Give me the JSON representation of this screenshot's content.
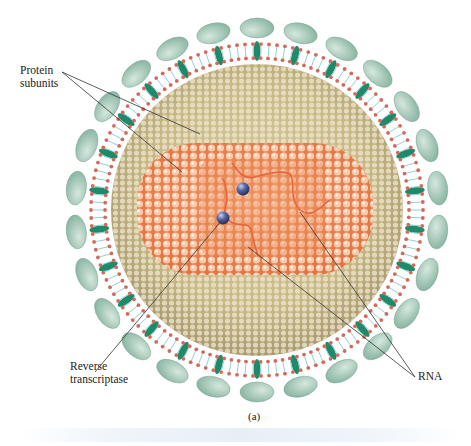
{
  "figure": {
    "caption": "(a)",
    "labels": {
      "protein_subunits": [
        "Protein",
        "subunits"
      ],
      "reverse_transcriptase": [
        "Reverse",
        "transcriptase"
      ],
      "rna": "RNA"
    },
    "colors": {
      "spike_head": "#a9c8b9",
      "spike_stalk": "#1e8a6a",
      "lipid_head": "#d06a5a",
      "lipid_tail": "#8fd0d8",
      "matrix_shell": "#c9b98a",
      "capsid": "#f08a55",
      "rna_strand": "#e8643a",
      "enzyme": "#4a5a9a",
      "leader_line": "#333333"
    },
    "counts": {
      "spikes": 26,
      "enzymes": 2
    }
  }
}
